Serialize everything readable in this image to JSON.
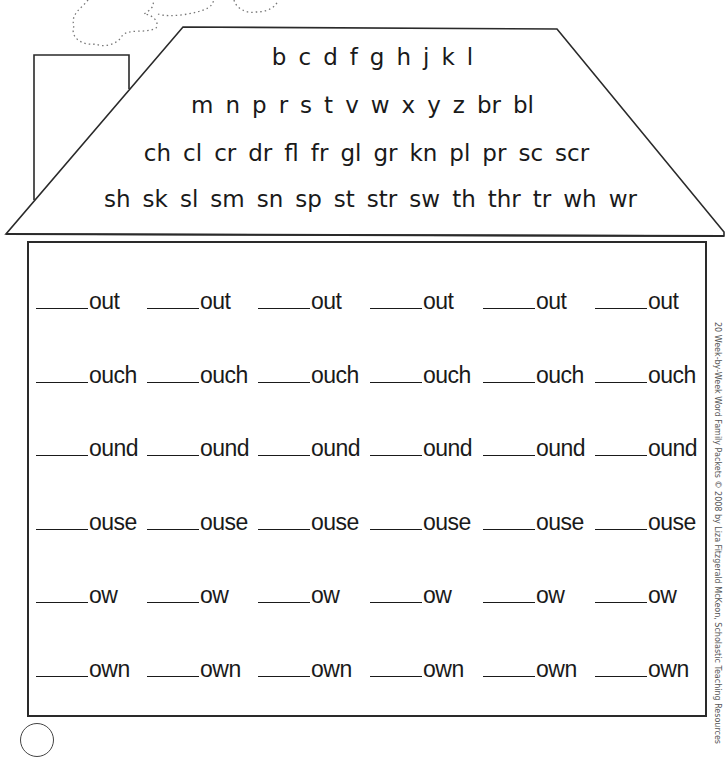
{
  "worksheet": {
    "roof": {
      "rows": [
        [
          "b",
          "c",
          "d",
          "f",
          "g",
          "h",
          "j",
          "k",
          "l"
        ],
        [
          "m",
          "n",
          "p",
          "r",
          "s",
          "t",
          "v",
          "w",
          "x",
          "y",
          "z",
          "br",
          "bl"
        ],
        [
          "ch",
          "cl",
          "cr",
          "dr",
          "fl",
          "fr",
          "gl",
          "gr",
          "kn",
          "pl",
          "pr",
          "sc",
          "scr"
        ],
        [
          "sh",
          "sk",
          "sl",
          "sm",
          "sn",
          "sp",
          "st",
          "str",
          "sw",
          "th",
          "thr",
          "tr",
          "wh",
          "wr"
        ]
      ]
    },
    "word_families": [
      {
        "ending": "out",
        "count": 6
      },
      {
        "ending": "ouch",
        "count": 6
      },
      {
        "ending": "ound",
        "count": 6
      },
      {
        "ending": "ouse",
        "count": 6
      },
      {
        "ending": "ow",
        "count": 6
      },
      {
        "ending": "own",
        "count": 6
      }
    ],
    "rows": {
      "r0": [
        "out",
        "out",
        "out",
        "out",
        "out",
        "out"
      ],
      "r1": [
        "ouch",
        "ouch",
        "ouch",
        "ouch",
        "ouch",
        "ouch"
      ],
      "r2": [
        "ound",
        "ound",
        "ound",
        "ound",
        "ound",
        "ound"
      ],
      "r3": [
        "ouse",
        "ouse",
        "ouse",
        "ouse",
        "ouse",
        "ouse"
      ],
      "r4": [
        "ow",
        "ow",
        "ow",
        "ow",
        "ow",
        "ow"
      ],
      "r5": [
        "own",
        "own",
        "own",
        "own",
        "own",
        "own"
      ]
    },
    "credit": "20 Week-by-Week Word Family Packets © 2008 by Liza Fitzgerald McKeon, Scholastic Teaching Resources"
  }
}
